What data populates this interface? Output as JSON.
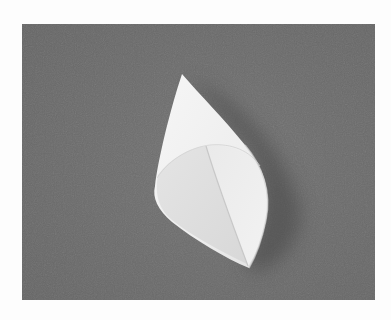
{
  "image": {
    "description": "Photograph of a white paper cone lying on a gray textured surface, framed by a white border",
    "subject": "paper cone",
    "colors": {
      "border": "#fdfdfd",
      "background_surface": "#6e6e6e",
      "surface_dark": "#5f5f5f",
      "shadow": "#4f4f4f",
      "paper_light": "#f4f4f4",
      "paper_mid": "#e6e6e6",
      "paper_inner": "#dcdcdc"
    },
    "photo_frame": {
      "x": 22,
      "y": 24,
      "width": 353,
      "height": 276
    }
  }
}
